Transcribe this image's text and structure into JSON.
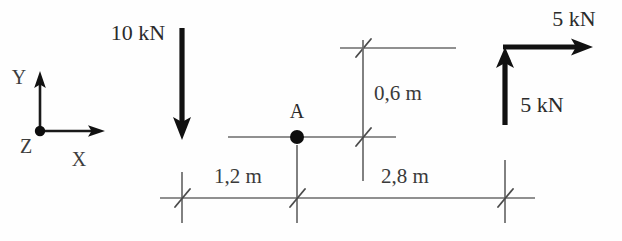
{
  "diagram": {
    "background_color": "#fefefe",
    "ink_color": "#111111",
    "line_color": "#6b6b6b",
    "width": 622,
    "height": 241
  },
  "coordinate_system": {
    "label_y": "Y",
    "label_x": "X",
    "label_z": "Z",
    "origin_marker": "filled-dot",
    "note": "Z points out of the page"
  },
  "forces": [
    {
      "id": "force-10kn-down",
      "label": "10 kN",
      "magnitude": 10,
      "unit": "kN",
      "direction": "down"
    },
    {
      "id": "force-5kn-right",
      "label": "5 kN",
      "magnitude": 5,
      "unit": "kN",
      "direction": "right"
    },
    {
      "id": "force-5kn-up",
      "label": "5 kN",
      "magnitude": 5,
      "unit": "kN",
      "direction": "up"
    }
  ],
  "points": [
    {
      "id": "point-a",
      "label": "A",
      "marker": "filled-dot"
    }
  ],
  "dimensions": [
    {
      "id": "dim-1-2m",
      "label": "1,2 m",
      "value": 1.2,
      "unit": "m",
      "orientation": "horizontal"
    },
    {
      "id": "dim-2-8m",
      "label": "2,8 m",
      "value": 2.8,
      "unit": "m",
      "orientation": "horizontal"
    },
    {
      "id": "dim-0-6m",
      "label": "0,6 m",
      "value": 0.6,
      "unit": "m",
      "orientation": "vertical"
    }
  ]
}
